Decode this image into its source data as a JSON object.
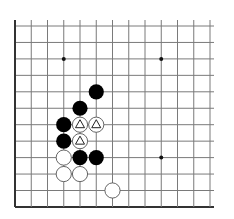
{
  "board": {
    "cols": 13,
    "rows": 12,
    "origin_x": 15,
    "origin_y": 26,
    "spacing_x": 16.25,
    "spacing_y": 16.45,
    "edges": {
      "left": true,
      "bottom": true,
      "top": false,
      "right": false
    },
    "line_color": "#7a7a7a",
    "edge_color": "#333333",
    "stone_radius": 7.6
  },
  "star_points": [
    {
      "c": 3,
      "r": 2
    },
    {
      "c": 9,
      "r": 2
    },
    {
      "c": 9,
      "r": 8
    }
  ],
  "stones": [
    {
      "color": "black",
      "c": 5,
      "r": 4,
      "mark": ""
    },
    {
      "color": "black",
      "c": 4,
      "r": 5,
      "mark": ""
    },
    {
      "color": "black",
      "c": 3,
      "r": 6,
      "mark": ""
    },
    {
      "color": "white",
      "c": 4,
      "r": 6,
      "mark": "triangle"
    },
    {
      "color": "white",
      "c": 5,
      "r": 6,
      "mark": "triangle"
    },
    {
      "color": "black",
      "c": 3,
      "r": 7,
      "mark": ""
    },
    {
      "color": "white",
      "c": 4,
      "r": 7,
      "mark": "triangle"
    },
    {
      "color": "white",
      "c": 3,
      "r": 8,
      "mark": ""
    },
    {
      "color": "black",
      "c": 4,
      "r": 8,
      "mark": ""
    },
    {
      "color": "black",
      "c": 5,
      "r": 8,
      "mark": ""
    },
    {
      "color": "white",
      "c": 3,
      "r": 9,
      "mark": ""
    },
    {
      "color": "white",
      "c": 4,
      "r": 9,
      "mark": ""
    },
    {
      "color": "white",
      "c": 6,
      "r": 10,
      "mark": ""
    }
  ]
}
